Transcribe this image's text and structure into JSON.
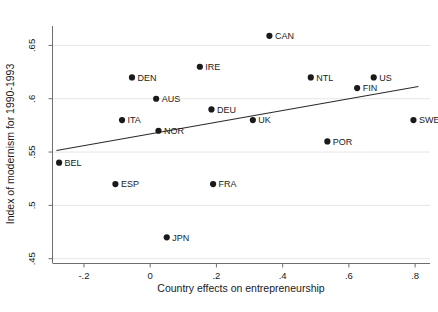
{
  "chart_data": {
    "type": "scatter",
    "title": "",
    "xlabel": "Country effects on entrepreneurship",
    "ylabel": "Index of modernism for 1990-1993",
    "xlim": [
      -0.295,
      0.845
    ],
    "ylim": [
      0.4455,
      0.6682
    ],
    "xticks": [
      -0.2,
      0,
      0.2,
      0.4,
      0.6,
      0.8
    ],
    "xtick_labels": [
      "-.2",
      "0",
      ".2",
      ".4",
      ".6",
      ".8"
    ],
    "yticks": [
      0.45,
      0.5,
      0.55,
      0.6,
      0.65
    ],
    "ytick_labels": [
      ".45",
      ".5",
      ".55",
      ".6",
      ".65"
    ],
    "grid": "horizontal",
    "marker_color": "#1a1a1a",
    "line_color": "#2a2a2a",
    "points": [
      {
        "label": "BEL",
        "x": -0.275,
        "y": 0.54,
        "label_pos": "right"
      },
      {
        "label": "ESP",
        "x": -0.105,
        "y": 0.52,
        "label_pos": "right"
      },
      {
        "label": "ITA",
        "x": -0.085,
        "y": 0.58,
        "label_pos": "right"
      },
      {
        "label": "DEN",
        "x": -0.055,
        "y": 0.62,
        "label_pos": "right"
      },
      {
        "label": "AUS",
        "x": 0.018,
        "y": 0.6,
        "label_pos": "right"
      },
      {
        "label": "NOR",
        "x": 0.025,
        "y": 0.57,
        "label_pos": "right"
      },
      {
        "label": "JPN",
        "x": 0.05,
        "y": 0.47,
        "label_pos": "right"
      },
      {
        "label": "IRE",
        "x": 0.15,
        "y": 0.63,
        "label_pos": "right"
      },
      {
        "label": "DEU",
        "x": 0.185,
        "y": 0.59,
        "label_pos": "right"
      },
      {
        "label": "FRA",
        "x": 0.19,
        "y": 0.52,
        "label_pos": "right"
      },
      {
        "label": "UK",
        "x": 0.31,
        "y": 0.58,
        "label_pos": "right"
      },
      {
        "label": "CAN",
        "x": 0.36,
        "y": 0.659,
        "label_pos": "right"
      },
      {
        "label": "NTL",
        "x": 0.485,
        "y": 0.62,
        "label_pos": "right"
      },
      {
        "label": "POR",
        "x": 0.535,
        "y": 0.56,
        "label_pos": "right"
      },
      {
        "label": "FIN",
        "x": 0.625,
        "y": 0.61,
        "label_pos": "right"
      },
      {
        "label": "US",
        "x": 0.675,
        "y": 0.62,
        "label_pos": "right"
      },
      {
        "label": "SWE",
        "x": 0.795,
        "y": 0.58,
        "label_pos": "right"
      }
    ],
    "fit_line": {
      "x_start": -0.283,
      "y_start": 0.5515,
      "x_end": 0.81,
      "y_end": 0.6115
    }
  }
}
